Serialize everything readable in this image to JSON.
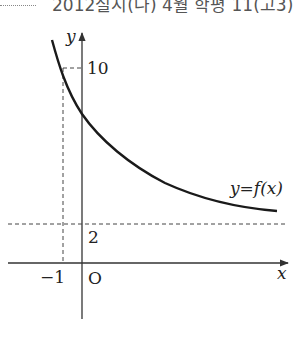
{
  "header": {
    "source_text": "2012실시(나) 4월 학평 11(고3)"
  },
  "graph": {
    "function_label": "y=f(x)",
    "x_axis_label": "x",
    "y_axis_label": "y",
    "origin_label": "O",
    "y_tick_10": "10",
    "asymptote_label": "2",
    "x_tick_neg1": "−1",
    "colors": {
      "curve": "#1a1a1a",
      "axis": "#333333",
      "dashed": "#444444",
      "text": "#222222"
    }
  }
}
